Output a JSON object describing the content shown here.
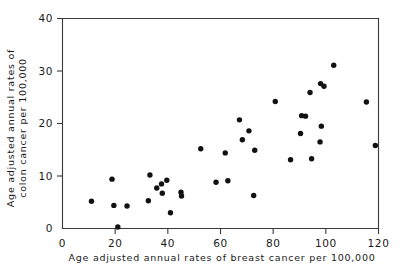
{
  "chart_data": {
    "type": "scatter",
    "title": "",
    "xlabel": "Age adjusted annual rates of breast cancer per 100,000",
    "ylabel_line1": "Age adjusted annual rates of",
    "ylabel_line2": "colon cancer per 100,000",
    "xlim": [
      0,
      120
    ],
    "ylim": [
      0,
      40
    ],
    "xticks": [
      0,
      20,
      40,
      60,
      80,
      100,
      120
    ],
    "yticks": [
      0,
      10,
      20,
      30,
      40
    ],
    "xtick_labels": [
      "0",
      "20",
      "40",
      "60",
      "80",
      "100",
      "120"
    ],
    "ytick_labels": [
      "0",
      "10",
      "20",
      "30",
      "40"
    ],
    "grid": false,
    "legend": false,
    "marker": "filled-circle",
    "marker_color": "#111111",
    "points": [
      {
        "x": 11.0,
        "y": 5.2
      },
      {
        "x": 18.8,
        "y": 9.4
      },
      {
        "x": 19.5,
        "y": 4.4
      },
      {
        "x": 21.0,
        "y": 0.3
      },
      {
        "x": 24.5,
        "y": 4.3
      },
      {
        "x": 32.6,
        "y": 5.3
      },
      {
        "x": 33.2,
        "y": 10.2
      },
      {
        "x": 35.8,
        "y": 7.7
      },
      {
        "x": 37.6,
        "y": 8.5
      },
      {
        "x": 37.9,
        "y": 6.7
      },
      {
        "x": 39.6,
        "y": 9.2
      },
      {
        "x": 41.0,
        "y": 3.0
      },
      {
        "x": 45.0,
        "y": 6.9
      },
      {
        "x": 45.2,
        "y": 6.2
      },
      {
        "x": 52.5,
        "y": 15.2
      },
      {
        "x": 58.3,
        "y": 8.8
      },
      {
        "x": 61.8,
        "y": 14.4
      },
      {
        "x": 62.8,
        "y": 9.1
      },
      {
        "x": 67.2,
        "y": 20.7
      },
      {
        "x": 68.3,
        "y": 16.9
      },
      {
        "x": 70.8,
        "y": 18.6
      },
      {
        "x": 72.6,
        "y": 6.3
      },
      {
        "x": 73.0,
        "y": 14.9
      },
      {
        "x": 80.8,
        "y": 24.2
      },
      {
        "x": 86.6,
        "y": 13.1
      },
      {
        "x": 90.4,
        "y": 18.1
      },
      {
        "x": 90.8,
        "y": 21.5
      },
      {
        "x": 92.3,
        "y": 21.4
      },
      {
        "x": 94.0,
        "y": 25.9
      },
      {
        "x": 94.6,
        "y": 13.3
      },
      {
        "x": 97.8,
        "y": 16.5
      },
      {
        "x": 98.0,
        "y": 27.6
      },
      {
        "x": 98.3,
        "y": 19.5
      },
      {
        "x": 99.3,
        "y": 27.1
      },
      {
        "x": 103.0,
        "y": 31.1
      },
      {
        "x": 115.4,
        "y": 24.1
      },
      {
        "x": 118.8,
        "y": 15.8
      }
    ]
  }
}
